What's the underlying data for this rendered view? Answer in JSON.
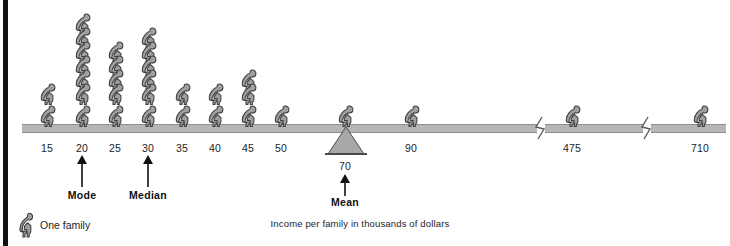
{
  "chart_data": {
    "type": "bar",
    "title": "",
    "subtitle": "",
    "xlabel": "Income per family in thousands of dollars",
    "ylabel": "",
    "unit_label": "One family",
    "unit_value": 1,
    "grid": false,
    "legend_position": "bottom-left",
    "categories": [
      "15",
      "20",
      "25",
      "30",
      "35",
      "40",
      "45",
      "50",
      "70",
      "90",
      "475",
      "710"
    ],
    "values": [
      2,
      7,
      5,
      6,
      2,
      2,
      3,
      1,
      1,
      1,
      1,
      1
    ],
    "annotations": [
      {
        "label": "Mode",
        "at": "20"
      },
      {
        "label": "Median",
        "at": "30"
      },
      {
        "label": "Mean",
        "at": "70"
      }
    ],
    "axis_breaks_before": [
      "475",
      "710"
    ],
    "fulcrum_at": "70"
  },
  "axis": {
    "ticks": [
      {
        "label": "15",
        "value": 15,
        "count": 2,
        "x": 47
      },
      {
        "label": "20",
        "value": 20,
        "count": 7,
        "x": 82
      },
      {
        "label": "25",
        "value": 25,
        "count": 5,
        "x": 115
      },
      {
        "label": "30",
        "value": 30,
        "count": 6,
        "x": 148
      },
      {
        "label": "35",
        "value": 35,
        "count": 2,
        "x": 182
      },
      {
        "label": "40",
        "value": 40,
        "count": 2,
        "x": 215
      },
      {
        "label": "45",
        "value": 45,
        "count": 3,
        "x": 248
      },
      {
        "label": "50",
        "value": 50,
        "count": 1,
        "x": 281
      },
      {
        "label": "70",
        "value": 70,
        "count": 1,
        "x": 345
      },
      {
        "label": "90",
        "value": 90,
        "count": 1,
        "x": 411
      },
      {
        "label": "475",
        "value": 475,
        "count": 1,
        "x": 572
      },
      {
        "label": "710",
        "value": 710,
        "count": 1,
        "x": 700
      }
    ]
  },
  "callouts": [
    {
      "name": "mode",
      "label": "Mode",
      "x": 82
    },
    {
      "name": "median",
      "label": "Median",
      "x": 148
    },
    {
      "name": "mean",
      "label": "Mean",
      "x": 345
    }
  ],
  "legend": {
    "label": "One family",
    "icon": "seated-person-icon"
  },
  "caption": {
    "text": "Income per family in thousands of dollars"
  },
  "colors": {
    "figure_fill": "#a0a0a0",
    "figure_stroke": "#3d3d3d",
    "beam": "#b6b6b6",
    "beam_edge": "#8e8e8e",
    "text": "#1d1d1d",
    "rule": "#121212",
    "fulcrum_fill": "#a8a8a8"
  }
}
